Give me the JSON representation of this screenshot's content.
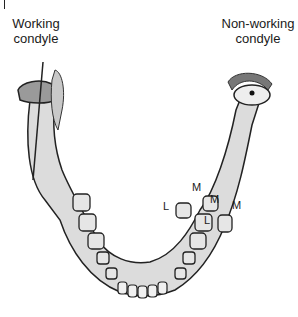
{
  "figure": {
    "labels": {
      "working": [
        "Working",
        "condyle"
      ],
      "non_working": [
        "Non-working",
        "condyle"
      ]
    },
    "tooth_labels": {
      "m_top": "M",
      "m_inner": "M",
      "l_left": "L",
      "l_inner": "L",
      "m_right": "M"
    },
    "colors": {
      "outline": "#222222",
      "bone_fill": "#d9d9d9",
      "shade": "#8a8a8a",
      "background": "#ffffff"
    }
  }
}
